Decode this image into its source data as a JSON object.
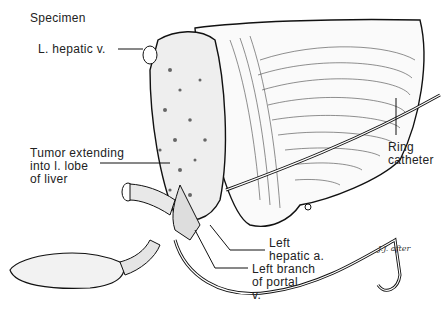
{
  "figure": {
    "title": "Specimen",
    "labels": {
      "hepatic_vein": "L. hepatic v.",
      "tumor_line1": "Tumor extending",
      "tumor_line2": "into l. lobe",
      "tumor_line3": "of liver",
      "catheter_line1": "Ring",
      "catheter_line2": "catheter",
      "artery_line1": "Left",
      "artery_line2": "hepatic a.",
      "portal_line1": "Left branch",
      "portal_line2": "of portal",
      "portal_line3": "v."
    },
    "signature": "J.J. after"
  }
}
